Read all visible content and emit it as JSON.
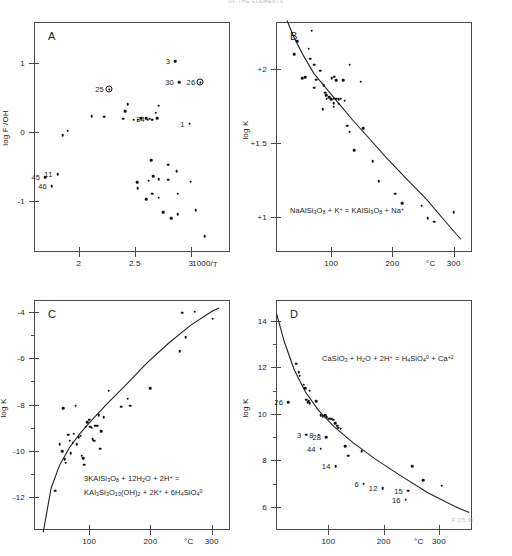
{
  "header": {
    "text": "OF THE ELEMENTS"
  },
  "figure_code": "F (75.9)",
  "chart_data": [
    {
      "id": "A",
      "type": "scatter",
      "panel_letter": "A",
      "title": "",
      "xlabel": "1000/T",
      "ylabel": "log F⁻/OH",
      "xlim": [
        1.6,
        3.35
      ],
      "ylim": [
        -1.75,
        1.6
      ],
      "xticks": [
        2,
        2.5,
        3
      ],
      "xticklabels": [
        "2",
        "2.5",
        "3"
      ],
      "yticks": [
        1,
        0,
        -1
      ],
      "yticklabels": [
        "1",
        "0",
        "-1"
      ],
      "grid": false,
      "has_curve": false,
      "points": [
        {
          "x": 1.7,
          "y": -0.66,
          "label": "45",
          "marker": "dot"
        },
        {
          "x": 1.76,
          "y": -0.79,
          "label": "46",
          "marker": "dot"
        },
        {
          "x": 1.81,
          "y": -0.62,
          "label": "11",
          "marker": "dot"
        },
        {
          "x": 1.855,
          "y": -0.05,
          "marker": "dot"
        },
        {
          "x": 1.9,
          "y": 0.02,
          "marker": "dot"
        },
        {
          "x": 2.115,
          "y": 0.23,
          "marker": "dot"
        },
        {
          "x": 2.225,
          "y": 0.22,
          "marker": "dot"
        },
        {
          "x": 2.27,
          "y": 0.62,
          "label": "25",
          "marker": "ring"
        },
        {
          "x": 2.395,
          "y": 0.19,
          "marker": "dot"
        },
        {
          "x": 2.415,
          "y": 0.3,
          "marker": "dot"
        },
        {
          "x": 2.435,
          "y": 0.4,
          "marker": "dot"
        },
        {
          "x": 2.49,
          "y": 0.175,
          "marker": "dot"
        },
        {
          "x": 2.525,
          "y": 0.175,
          "marker": "dot"
        },
        {
          "x": 2.555,
          "y": 0.2,
          "marker": "dot"
        },
        {
          "x": 2.6,
          "y": 0.2,
          "marker": "dot"
        },
        {
          "x": 2.615,
          "y": 0.175,
          "marker": "dot"
        },
        {
          "x": 2.635,
          "y": 0.19,
          "label": "34",
          "marker": "dot"
        },
        {
          "x": 2.655,
          "y": 0.175,
          "marker": "dot"
        },
        {
          "x": 2.685,
          "y": 0.28,
          "marker": "dot"
        },
        {
          "x": 2.7,
          "y": 0.2,
          "marker": "dot"
        },
        {
          "x": 2.715,
          "y": 0.38,
          "marker": "dot"
        },
        {
          "x": 2.86,
          "y": 1.03,
          "label": "3",
          "marker": "dot"
        },
        {
          "x": 2.895,
          "y": 0.72,
          "label": "30",
          "marker": "dot"
        },
        {
          "x": 3.085,
          "y": 0.72,
          "label": "26",
          "marker": "ring"
        },
        {
          "x": 2.99,
          "y": 0.12,
          "label": "1",
          "marker": "dot"
        },
        {
          "x": 2.645,
          "y": -0.41,
          "marker": "dot"
        },
        {
          "x": 2.8,
          "y": -0.48,
          "marker": "dot"
        },
        {
          "x": 2.875,
          "y": -0.57,
          "marker": "dot"
        },
        {
          "x": 2.52,
          "y": -0.735,
          "marker": "dot"
        },
        {
          "x": 2.525,
          "y": -0.82,
          "marker": "dot"
        },
        {
          "x": 2.625,
          "y": -0.71,
          "marker": "dot"
        },
        {
          "x": 2.665,
          "y": -0.645,
          "marker": "dot"
        },
        {
          "x": 2.715,
          "y": -0.69,
          "marker": "dot"
        },
        {
          "x": 2.8,
          "y": -0.695,
          "marker": "dot"
        },
        {
          "x": 3.0,
          "y": -0.725,
          "marker": "dot"
        },
        {
          "x": 2.6,
          "y": -0.98,
          "marker": "dot"
        },
        {
          "x": 2.655,
          "y": -0.9,
          "marker": "dot"
        },
        {
          "x": 2.715,
          "y": -0.96,
          "marker": "dot"
        },
        {
          "x": 2.885,
          "y": -0.9,
          "marker": "dot"
        },
        {
          "x": 2.755,
          "y": -1.17,
          "marker": "dot"
        },
        {
          "x": 2.825,
          "y": -1.26,
          "marker": "dot"
        },
        {
          "x": 2.885,
          "y": -1.2,
          "marker": "dot"
        },
        {
          "x": 3.045,
          "y": -1.14,
          "marker": "dot"
        },
        {
          "x": 3.125,
          "y": -1.52,
          "marker": "dot"
        }
      ]
    },
    {
      "id": "B",
      "type": "scatter",
      "panel_letter": "B",
      "title": "",
      "xlabel": "°C",
      "ylabel": "log K",
      "equation": "NaAlSi3O8 + K+ = KAlSi3O8 + Na+",
      "xlim": [
        10,
        330
      ],
      "ylim": [
        0.76,
        2.32
      ],
      "xticks": [
        100,
        200,
        300
      ],
      "xticklabels": [
        "100",
        "200",
        "300"
      ],
      "yticks": [
        2,
        1.5,
        1
      ],
      "yticklabels": [
        "+2",
        "+1.5",
        "+1"
      ],
      "grid": false,
      "has_curve": true,
      "points": [
        {
          "x": 45,
          "y": 2.19
        },
        {
          "x": 68,
          "y": 2.26
        },
        {
          "x": 40,
          "y": 2.1
        },
        {
          "x": 63,
          "y": 2.14
        },
        {
          "x": 66,
          "y": 2.07
        },
        {
          "x": 72,
          "y": 2.03
        },
        {
          "x": 82,
          "y": 1.99
        },
        {
          "x": 53,
          "y": 1.94
        },
        {
          "x": 58,
          "y": 1.945
        },
        {
          "x": 76,
          "y": 1.93
        },
        {
          "x": 101,
          "y": 1.94
        },
        {
          "x": 105,
          "y": 1.95
        },
        {
          "x": 108,
          "y": 1.925
        },
        {
          "x": 120,
          "y": 1.925
        },
        {
          "x": 130,
          "y": 2.03
        },
        {
          "x": 148,
          "y": 1.915
        },
        {
          "x": 72,
          "y": 1.875
        },
        {
          "x": 88,
          "y": 1.89
        },
        {
          "x": 90,
          "y": 1.84
        },
        {
          "x": 92,
          "y": 1.825
        },
        {
          "x": 93,
          "y": 1.8
        },
        {
          "x": 97,
          "y": 1.81
        },
        {
          "x": 100,
          "y": 1.795
        },
        {
          "x": 104,
          "y": 1.8
        },
        {
          "x": 108,
          "y": 1.8
        },
        {
          "x": 112,
          "y": 1.795
        },
        {
          "x": 116,
          "y": 1.8
        },
        {
          "x": 122,
          "y": 1.785
        },
        {
          "x": 104,
          "y": 1.77
        },
        {
          "x": 112,
          "y": 1.765
        },
        {
          "x": 86,
          "y": 1.73
        },
        {
          "x": 104,
          "y": 1.745
        },
        {
          "x": 126,
          "y": 1.615
        },
        {
          "x": 130,
          "y": 1.575
        },
        {
          "x": 152,
          "y": 1.6
        },
        {
          "x": 138,
          "y": 1.45
        },
        {
          "x": 168,
          "y": 1.375
        },
        {
          "x": 178,
          "y": 1.24
        },
        {
          "x": 205,
          "y": 1.155
        },
        {
          "x": 216,
          "y": 1.09
        },
        {
          "x": 248,
          "y": 1.075
        },
        {
          "x": 258,
          "y": 0.99
        },
        {
          "x": 268,
          "y": 0.965
        },
        {
          "x": 300,
          "y": 1.03
        }
      ],
      "curve": [
        {
          "x": 28,
          "y": 2.33
        },
        {
          "x": 40,
          "y": 2.21
        },
        {
          "x": 55,
          "y": 2.09
        },
        {
          "x": 72,
          "y": 1.97
        },
        {
          "x": 92,
          "y": 1.87
        },
        {
          "x": 112,
          "y": 1.77
        },
        {
          "x": 135,
          "y": 1.655
        },
        {
          "x": 160,
          "y": 1.54
        },
        {
          "x": 190,
          "y": 1.4
        },
        {
          "x": 220,
          "y": 1.27
        },
        {
          "x": 255,
          "y": 1.12
        },
        {
          "x": 290,
          "y": 0.95
        },
        {
          "x": 312,
          "y": 0.845
        }
      ]
    },
    {
      "id": "C",
      "type": "scatter",
      "panel_letter": "C",
      "title": "",
      "xlabel": "°C",
      "ylabel": "log K",
      "equation_line1": "3KAlSi3O8 + 12H2O + 2H+ =",
      "equation_line2": "KAl3Si3O10(OH)2 + 2K+ + 6H4SiO4 0",
      "xlim": [
        10,
        330
      ],
      "ylim": [
        -13.4,
        -3.5
      ],
      "xticks": [
        100,
        200,
        300
      ],
      "xticklabels": [
        "100",
        "200",
        "300"
      ],
      "yticks": [
        -4,
        -6,
        -8,
        -10,
        -12
      ],
      "yticklabels": [
        "-4",
        "-6",
        "-8",
        "-10",
        "-12"
      ],
      "yminorticks": [
        -5,
        -7,
        -9,
        -11
      ],
      "grid": false,
      "has_curve": true,
      "points": [
        {
          "x": 45,
          "y": -11.7
        },
        {
          "x": 52,
          "y": -9.7
        },
        {
          "x": 56,
          "y": -10.0
        },
        {
          "x": 58,
          "y": -8.15
        },
        {
          "x": 60,
          "y": -10.35
        },
        {
          "x": 62,
          "y": -10.5
        },
        {
          "x": 66,
          "y": -9.3
        },
        {
          "x": 68,
          "y": -9.55
        },
        {
          "x": 70,
          "y": -10.1
        },
        {
          "x": 73,
          "y": -9.65
        },
        {
          "x": 75,
          "y": -9.25
        },
        {
          "x": 78,
          "y": -8.05
        },
        {
          "x": 80,
          "y": -9.7
        },
        {
          "x": 83,
          "y": -9.4
        },
        {
          "x": 86,
          "y": -9.35
        },
        {
          "x": 88,
          "y": -10.2
        },
        {
          "x": 90,
          "y": -10.3
        },
        {
          "x": 92,
          "y": -10.6
        },
        {
          "x": 94,
          "y": -8.95
        },
        {
          "x": 97,
          "y": -8.75
        },
        {
          "x": 100,
          "y": -8.65
        },
        {
          "x": 102,
          "y": -8.95
        },
        {
          "x": 104,
          "y": -9.0
        },
        {
          "x": 106,
          "y": -9.5
        },
        {
          "x": 108,
          "y": -9.55
        },
        {
          "x": 110,
          "y": -8.9
        },
        {
          "x": 113,
          "y": -8.9
        },
        {
          "x": 116,
          "y": -8.45
        },
        {
          "x": 118,
          "y": -9.9
        },
        {
          "x": 120,
          "y": -9.15
        },
        {
          "x": 124,
          "y": -8.55
        },
        {
          "x": 132,
          "y": -7.4
        },
        {
          "x": 152,
          "y": -8.1
        },
        {
          "x": 163,
          "y": -7.75
        },
        {
          "x": 167,
          "y": -8.05
        },
        {
          "x": 200,
          "y": -7.3
        },
        {
          "x": 248,
          "y": -5.7
        },
        {
          "x": 258,
          "y": -5.1
        },
        {
          "x": 252,
          "y": -4.05
        },
        {
          "x": 272,
          "y": -4.0
        },
        {
          "x": 302,
          "y": -4.3
        }
      ],
      "curve": [
        {
          "x": 25,
          "y": -13.5
        },
        {
          "x": 38,
          "y": -11.6
        },
        {
          "x": 52,
          "y": -10.6
        },
        {
          "x": 68,
          "y": -9.85
        },
        {
          "x": 85,
          "y": -9.25
        },
        {
          "x": 105,
          "y": -8.65
        },
        {
          "x": 130,
          "y": -7.95
        },
        {
          "x": 160,
          "y": -7.15
        },
        {
          "x": 195,
          "y": -6.2
        },
        {
          "x": 230,
          "y": -5.35
        },
        {
          "x": 265,
          "y": -4.6
        },
        {
          "x": 300,
          "y": -4.0
        },
        {
          "x": 312,
          "y": -3.85
        }
      ]
    },
    {
      "id": "D",
      "type": "scatter",
      "panel_letter": "D",
      "title": "",
      "xlabel": "°C",
      "ylabel": "log K",
      "equation": "CaSiO3 + H2O + 2H+ = H4SiO4 0 + Ca+2",
      "xlim": [
        5,
        360
      ],
      "ylim": [
        5.0,
        14.9
      ],
      "xticks": [
        100,
        200,
        300
      ],
      "xticklabels": [
        "100",
        "200",
        "300"
      ],
      "yticks": [
        14,
        12,
        10,
        8,
        6
      ],
      "yticklabels": [
        "14",
        "12",
        "10",
        "8",
        "6"
      ],
      "yminorticks": [
        13,
        11,
        9,
        7
      ],
      "grid": false,
      "has_curve": true,
      "points": [
        {
          "x": 42,
          "y": 12.15
        },
        {
          "x": 46,
          "y": 11.8
        },
        {
          "x": 48,
          "y": 11.65
        },
        {
          "x": 55,
          "y": 11.25
        },
        {
          "x": 58,
          "y": 11.1
        },
        {
          "x": 66,
          "y": 11.0
        },
        {
          "x": 60,
          "y": 10.6
        },
        {
          "x": 62,
          "y": 10.5
        },
        {
          "x": 64,
          "y": 10.55
        },
        {
          "x": 66,
          "y": 10.45
        },
        {
          "x": 78,
          "y": 10.55
        },
        {
          "x": 27,
          "y": 10.5,
          "label": "26"
        },
        {
          "x": 86,
          "y": 9.95
        },
        {
          "x": 90,
          "y": 9.9
        },
        {
          "x": 94,
          "y": 9.95
        },
        {
          "x": 97,
          "y": 9.85
        },
        {
          "x": 100,
          "y": 9.8
        },
        {
          "x": 103,
          "y": 9.8
        },
        {
          "x": 106,
          "y": 9.8
        },
        {
          "x": 109,
          "y": 9.75
        },
        {
          "x": 112,
          "y": 9.6
        },
        {
          "x": 116,
          "y": 9.5
        },
        {
          "x": 118,
          "y": 9.4
        },
        {
          "x": 122,
          "y": 9.35
        },
        {
          "x": 60,
          "y": 9.1,
          "label": "3"
        },
        {
          "x": 82,
          "y": 9.1,
          "label": "8"
        },
        {
          "x": 96,
          "y": 9.0,
          "label": "28"
        },
        {
          "x": 86,
          "y": 8.5,
          "label": "44"
        },
        {
          "x": 130,
          "y": 8.6
        },
        {
          "x": 136,
          "y": 8.2
        },
        {
          "x": 160,
          "y": 8.4
        },
        {
          "x": 113,
          "y": 7.75,
          "label": "14"
        },
        {
          "x": 164,
          "y": 7.0,
          "label": "6"
        },
        {
          "x": 198,
          "y": 6.8,
          "label": "12"
        },
        {
          "x": 244,
          "y": 6.7,
          "label": "15"
        },
        {
          "x": 240,
          "y": 6.3,
          "label": "16"
        },
        {
          "x": 252,
          "y": 7.75
        },
        {
          "x": 272,
          "y": 7.15
        },
        {
          "x": 305,
          "y": 6.9
        }
      ],
      "curve": [
        {
          "x": 6,
          "y": 14.3
        },
        {
          "x": 20,
          "y": 13.1
        },
        {
          "x": 38,
          "y": 11.9
        },
        {
          "x": 58,
          "y": 10.95
        },
        {
          "x": 82,
          "y": 10.15
        },
        {
          "x": 110,
          "y": 9.45
        },
        {
          "x": 145,
          "y": 8.75
        },
        {
          "x": 185,
          "y": 8.05
        },
        {
          "x": 230,
          "y": 7.35
        },
        {
          "x": 280,
          "y": 6.6
        },
        {
          "x": 330,
          "y": 6.0
        },
        {
          "x": 355,
          "y": 5.75
        }
      ]
    }
  ]
}
